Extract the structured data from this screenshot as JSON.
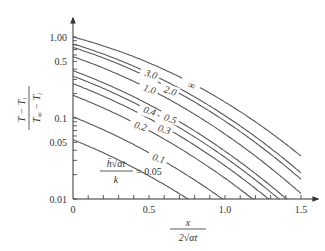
{
  "chart_data": {
    "type": "line",
    "title": "",
    "xlabel": "x / (2√(αt))",
    "ylabel": "(T − T_i) / (T_∞ − T_i)",
    "xscale": "linear",
    "yscale": "log",
    "xlim": [
      0,
      1.6
    ],
    "ylim": [
      0.01,
      1.0
    ],
    "x_ticks": [
      0,
      0.5,
      1.0,
      1.5
    ],
    "x_tick_labels": [
      "0",
      "0.5",
      "1.0",
      "1.5"
    ],
    "y_ticks": [
      0.01,
      0.05,
      0.1,
      0.5,
      1.0
    ],
    "y_tick_labels": [
      "0.01",
      "0.05",
      "0.1",
      "0.5",
      "1.00"
    ],
    "parameter_label": "h̄√(αt)/k",
    "parameter_label_prefix": "=",
    "grid": false,
    "legend": "inline curve labels",
    "series": [
      {
        "name": "0.05",
        "param": 0.05,
        "x": [
          0,
          0.25,
          0.5,
          0.76
        ],
        "values": [
          0.054,
          0.036,
          0.022,
          0.01
        ]
      },
      {
        "name": "0.1",
        "param": 0.1,
        "x": [
          0,
          0.25,
          0.5,
          0.75,
          0.98
        ],
        "values": [
          0.104,
          0.07,
          0.044,
          0.022,
          0.01
        ]
      },
      {
        "name": "0.2",
        "param": 0.2,
        "x": [
          0,
          0.25,
          0.5,
          0.75,
          1.0,
          1.12
        ],
        "values": [
          0.19,
          0.13,
          0.083,
          0.045,
          0.019,
          0.01
        ]
      },
      {
        "name": "0.3",
        "param": 0.3,
        "x": [
          0,
          0.25,
          0.5,
          0.75,
          1.0,
          1.2
        ],
        "values": [
          0.26,
          0.18,
          0.115,
          0.063,
          0.028,
          0.01
        ]
      },
      {
        "name": "0.4",
        "param": 0.4,
        "x": [
          0,
          0.25,
          0.5,
          0.75,
          1.0,
          1.25
        ],
        "values": [
          0.33,
          0.23,
          0.145,
          0.08,
          0.036,
          0.01
        ]
      },
      {
        "name": "0.5",
        "param": 0.5,
        "x": [
          0,
          0.25,
          0.5,
          0.75,
          1.0,
          1.28
        ],
        "values": [
          0.38,
          0.27,
          0.17,
          0.095,
          0.043,
          0.01
        ]
      },
      {
        "name": "1.0",
        "param": 1.0,
        "x": [
          0,
          0.25,
          0.5,
          0.75,
          1.0,
          1.35
        ],
        "values": [
          0.57,
          0.41,
          0.26,
          0.15,
          0.068,
          0.01
        ]
      },
      {
        "name": "2.0",
        "param": 2.0,
        "x": [
          0,
          0.25,
          0.5,
          0.75,
          1.0,
          1.25,
          1.48
        ],
        "values": [
          0.75,
          0.54,
          0.35,
          0.2,
          0.094,
          0.035,
          0.012
        ]
      },
      {
        "name": "3.0",
        "param": 3.0,
        "x": [
          0,
          0.25,
          0.5,
          0.75,
          1.0,
          1.25,
          1.5
        ],
        "values": [
          0.83,
          0.6,
          0.39,
          0.22,
          0.1,
          0.04,
          0.014
        ]
      },
      {
        "name": "∞",
        "param": "inf",
        "x": [
          0,
          0.25,
          0.5,
          0.75,
          1.0,
          1.25,
          1.5
        ],
        "values": [
          1.0,
          0.72,
          0.48,
          0.29,
          0.157,
          0.077,
          0.034
        ]
      }
    ],
    "curve_labels": [
      {
        "text": "∞",
        "param": "inf"
      },
      {
        "text": "3.0",
        "param": 3.0
      },
      {
        "text": "2.0",
        "param": 2.0
      },
      {
        "text": "1.0",
        "param": 1.0
      },
      {
        "text": "0.5",
        "param": 0.5
      },
      {
        "text": "0.4",
        "param": 0.4
      },
      {
        "text": "0.3",
        "param": 0.3
      },
      {
        "text": "0.2",
        "param": 0.2
      },
      {
        "text": "0.1",
        "param": 0.1
      },
      {
        "text": "0.05",
        "param": 0.05
      }
    ]
  },
  "axis": {
    "x_num": "x",
    "x_den": "2√αt",
    "y_num": "T − T",
    "y_num_sub": "i",
    "y_den": "T",
    "y_den_sub": "∞",
    "y_den_rest": " − T",
    "y_den_sub2": "i",
    "param_num": "h̄√αt",
    "param_den": "k",
    "param_eq": "= 0.05"
  }
}
